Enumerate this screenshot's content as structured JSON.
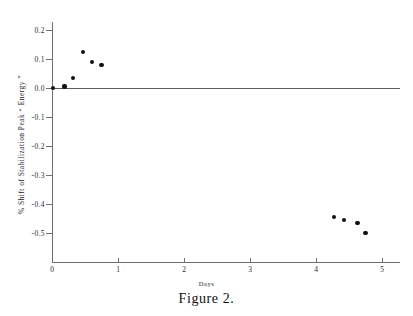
{
  "figure": {
    "caption": "Figure 2."
  },
  "chart_data": {
    "type": "scatter",
    "title": "",
    "xlabel": "Days",
    "ylabel": "% Shift of Stabilization Peak “ Energy ”",
    "xlim": [
      0,
      5.3
    ],
    "ylim": [
      -0.55,
      0.25
    ],
    "xticks": [
      0,
      1,
      2,
      3,
      4,
      5
    ],
    "xtick_labels": [
      "0",
      "1",
      "2",
      "3",
      "4",
      "5"
    ],
    "yticks": [
      0.2,
      0.1,
      0.0,
      -0.1,
      -0.2,
      -0.3,
      -0.4,
      -0.5
    ],
    "ytick_labels": [
      "0.2",
      "0.1",
      "0.0",
      "-0.1",
      "-0.2",
      "-0.3",
      "-0.4",
      "-0.5"
    ],
    "grid": false,
    "legend": null,
    "reference_line": {
      "y": 0.0,
      "label": "zero-shift-line"
    },
    "marker": {
      "shape": "circle",
      "color": "#111111",
      "size": 4
    },
    "series": [
      {
        "name": "% shift of stabilization peak energy",
        "points": [
          {
            "x": 0.02,
            "y": 0.0
          },
          {
            "x": 0.19,
            "y": 0.005
          },
          {
            "x": 0.32,
            "y": 0.035
          },
          {
            "x": 0.47,
            "y": 0.125
          },
          {
            "x": 0.6,
            "y": 0.09
          },
          {
            "x": 0.75,
            "y": 0.08
          },
          {
            "x": 4.27,
            "y": -0.445
          },
          {
            "x": 4.42,
            "y": -0.455
          },
          {
            "x": 4.63,
            "y": -0.465
          },
          {
            "x": 4.75,
            "y": -0.5
          }
        ]
      }
    ]
  }
}
